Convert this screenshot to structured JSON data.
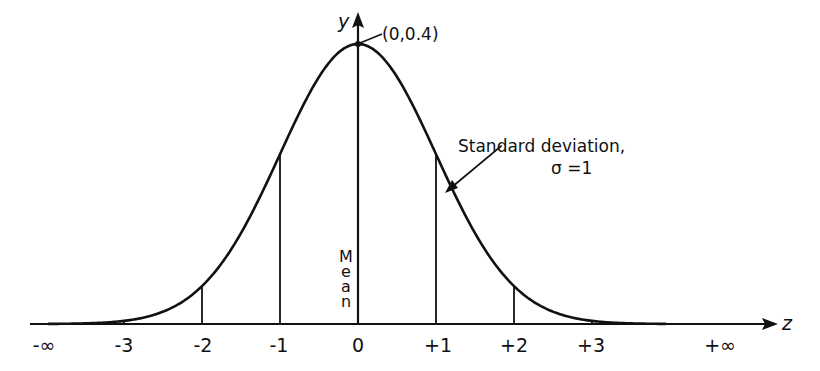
{
  "diagram": {
    "axes": {
      "x_name": "z",
      "y_name": "y",
      "x_ticks": [
        "-∞",
        "-3",
        "-2",
        "-1",
        "0",
        "+1",
        "+2",
        "+3",
        "+∞"
      ]
    },
    "peak_label": "(0,0.4)",
    "mean_label": "Mean",
    "sd_label_line1": "Standard deviation,",
    "sd_label_line2": "σ =1",
    "colors": {
      "ink": "#111111",
      "background": "#ffffff"
    }
  },
  "chart_data": {
    "type": "line",
    "xlabel": "z",
    "ylabel": "y",
    "x": [
      -3.9,
      -3,
      -2,
      -1,
      0,
      1,
      2,
      3,
      3.9
    ],
    "values": [
      0.0002,
      0.0044,
      0.054,
      0.242,
      0.4,
      0.242,
      0.054,
      0.0044,
      0.0002
    ],
    "vertical_lines_at": [
      -3,
      -2,
      -1,
      0,
      1,
      2,
      3
    ],
    "annotations": [
      "(0,0.4)",
      "Mean",
      "Standard deviation, σ =1"
    ],
    "grid": false
  }
}
